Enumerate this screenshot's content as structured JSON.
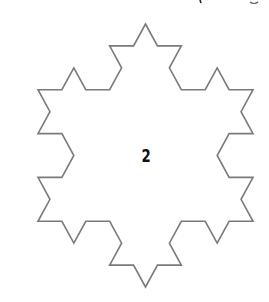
{
  "figure": {
    "type": "koch-snowflake",
    "iteration_label": "2",
    "iteration": 2,
    "center": [
      145.5,
      155.5
    ],
    "radius_y": 131.5,
    "half_width_x": 107.5,
    "stroke_color": "#7a7a7a",
    "fill_color": "#ffffff",
    "stroke_width": 1.6,
    "label_color": "#111111"
  }
}
